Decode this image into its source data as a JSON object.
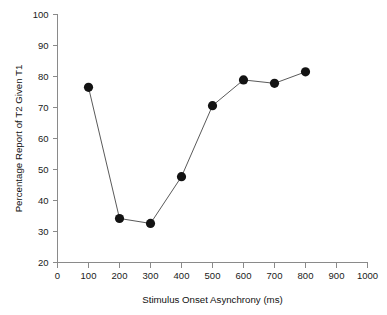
{
  "chart_data": {
    "type": "line",
    "title": "",
    "subtitle": "",
    "xlabel": "Stimulus Onset Asynchrony (ms)",
    "ylabel": "Percentage Report of T2 Given T1",
    "x": [
      100,
      200,
      300,
      400,
      500,
      600,
      700,
      800
    ],
    "values": [
      76.5,
      34.2,
      32.6,
      47.7,
      70.6,
      78.9,
      77.8,
      81.5
    ],
    "series": [
      {
        "name": "Percentage Report of T2 Given T1",
        "x": [
          100,
          200,
          300,
          400,
          500,
          600,
          700,
          800
        ],
        "values": [
          76.5,
          34.2,
          32.6,
          47.7,
          70.6,
          78.9,
          77.8,
          81.5
        ]
      }
    ],
    "xlim": [
      0,
      1000
    ],
    "ylim": [
      20,
      100
    ],
    "xticks": [
      0,
      100,
      200,
      300,
      400,
      500,
      600,
      700,
      800,
      900,
      1000
    ],
    "yticks": [
      20,
      30,
      40,
      50,
      60,
      70,
      80,
      90,
      100
    ],
    "xtick_labels": [
      "0",
      "100",
      "200",
      "300",
      "400",
      "500",
      "600",
      "700",
      "800",
      "900",
      "1000"
    ],
    "ytick_labels": [
      "20",
      "30",
      "40",
      "50",
      "60",
      "70",
      "80",
      "90",
      "100"
    ],
    "grid": false,
    "legend": false,
    "legend_position": "none",
    "annotations": [],
    "marker": "filled-circle",
    "colors": {
      "marker": "#131313",
      "line": "#5a5a5a",
      "axis": "#8a8a8a",
      "text": "#1a1a1a",
      "background": "#ffffff"
    }
  }
}
